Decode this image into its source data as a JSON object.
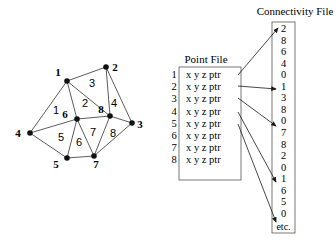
{
  "mesh": {
    "nodes": [
      {
        "id": "1",
        "x": 67,
        "y": 81,
        "lx": 58,
        "ly": 76
      },
      {
        "id": "2",
        "x": 106,
        "y": 67,
        "lx": 115,
        "ly": 71
      },
      {
        "id": "3",
        "x": 132,
        "y": 123,
        "lx": 140,
        "ly": 128
      },
      {
        "id": "4",
        "x": 30,
        "y": 133,
        "lx": 18,
        "ly": 137
      },
      {
        "id": "5",
        "x": 67,
        "y": 158,
        "lx": 56,
        "ly": 168
      },
      {
        "id": "6",
        "x": 77,
        "y": 119,
        "lx": 65,
        "ly": 118
      },
      {
        "id": "7",
        "x": 94,
        "y": 156,
        "lx": 96,
        "ly": 168
      },
      {
        "id": "8",
        "x": 110,
        "y": 116,
        "lx": 101,
        "ly": 113
      }
    ],
    "edges": [
      [
        "1",
        "2"
      ],
      [
        "1",
        "4"
      ],
      [
        "1",
        "6"
      ],
      [
        "1",
        "8"
      ],
      [
        "2",
        "8"
      ],
      [
        "2",
        "3"
      ],
      [
        "8",
        "3"
      ],
      [
        "4",
        "6"
      ],
      [
        "4",
        "5"
      ],
      [
        "6",
        "5"
      ],
      [
        "6",
        "7"
      ],
      [
        "6",
        "8"
      ],
      [
        "5",
        "7"
      ],
      [
        "7",
        "8"
      ],
      [
        "7",
        "3"
      ]
    ],
    "triangles": [
      {
        "id": "1",
        "x": 56,
        "y": 114
      },
      {
        "id": "2",
        "x": 85,
        "y": 107
      },
      {
        "id": "3",
        "x": 92,
        "y": 87
      },
      {
        "id": "4",
        "x": 114,
        "y": 107
      },
      {
        "id": "5",
        "x": 61,
        "y": 141
      },
      {
        "id": "6",
        "x": 79,
        "y": 146
      },
      {
        "id": "7",
        "x": 93,
        "y": 136
      },
      {
        "id": "8",
        "x": 113,
        "y": 137
      }
    ]
  },
  "point_file": {
    "title": "Point File",
    "rows": [
      {
        "index": "1",
        "fields": "x  y  z  ptr"
      },
      {
        "index": "2",
        "fields": "x  y  z  ptr"
      },
      {
        "index": "3",
        "fields": "x  y  z  ptr"
      },
      {
        "index": "4",
        "fields": "x  y  z  ptr"
      },
      {
        "index": "5",
        "fields": "x  y  z  ptr"
      },
      {
        "index": "6",
        "fields": "x  y  z  ptr"
      },
      {
        "index": "7",
        "fields": "x  y  z  ptr"
      },
      {
        "index": "8",
        "fields": "x  y  z  ptr"
      }
    ]
  },
  "connectivity_file": {
    "title": "Connectivity File",
    "values": [
      "2",
      "8",
      "6",
      "4",
      "0",
      "1",
      "3",
      "8",
      "0",
      "7",
      "8",
      "2",
      "0",
      "1",
      "6",
      "5",
      "0"
    ],
    "more": "etc."
  }
}
